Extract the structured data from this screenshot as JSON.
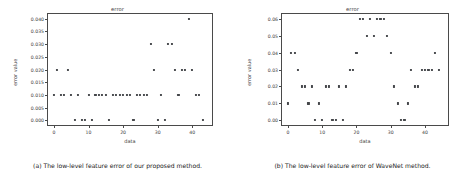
{
  "figures": [
    {
      "caption": "(a) The low-level feature error of our proposed method.",
      "chart_data": {
        "type": "scatter",
        "title": "error",
        "xlabel": "data",
        "ylabel": "error value",
        "xlim": [
          -2,
          46
        ],
        "ylim": [
          -0.0022,
          0.0422
        ],
        "xticks": [
          0,
          10,
          20,
          30,
          40
        ],
        "xticklabels": [
          "0",
          "10",
          "20",
          "30",
          "40"
        ],
        "yticks": [
          0.0,
          0.005,
          0.01,
          0.015,
          0.02,
          0.025,
          0.03,
          0.035,
          0.04
        ],
        "yticklabels": [
          "0.000",
          "0.005",
          "0.010",
          "0.015",
          "0.020",
          "0.025",
          "0.030",
          "0.035",
          "0.040"
        ],
        "grid": false,
        "legend": null,
        "marker_color": "#44464a",
        "x": [
          0,
          1,
          2,
          3,
          4,
          5,
          6,
          7,
          8,
          9,
          10,
          11,
          12,
          13,
          14,
          15,
          16,
          17,
          18,
          19,
          20,
          21,
          22,
          23,
          24,
          25,
          26,
          27,
          28,
          29,
          30,
          31,
          32,
          33,
          34,
          35,
          36,
          37,
          38,
          39,
          40,
          41,
          42,
          43
        ],
        "y": [
          0.01,
          0.02,
          0.01,
          0.01,
          0.02,
          0.01,
          0.0,
          0.01,
          0.0,
          0.0,
          0.01,
          0.0,
          0.01,
          0.01,
          0.01,
          0.01,
          0.0,
          0.01,
          0.01,
          0.01,
          0.01,
          0.01,
          0.01,
          0.0,
          0.01,
          0.01,
          0.01,
          0.01,
          0.03,
          0.02,
          0.0,
          0.01,
          0.0,
          0.03,
          0.03,
          0.02,
          0.01,
          0.02,
          0.02,
          0.04,
          0.02,
          0.01,
          0.01,
          0.0
        ]
      }
    },
    {
      "caption": "(b) The low-level feature error of WaveNet method.",
      "chart_data": {
        "type": "scatter",
        "title": "error",
        "xlabel": "data",
        "ylabel": "error value",
        "xlim": [
          -2,
          47
        ],
        "ylim": [
          -0.0033,
          0.0633
        ],
        "xticks": [
          0,
          10,
          20,
          30,
          40
        ],
        "xticklabels": [
          "0",
          "10",
          "20",
          "30",
          "40"
        ],
        "yticks": [
          0.0,
          0.01,
          0.02,
          0.03,
          0.04,
          0.05,
          0.06
        ],
        "yticklabels": [
          "0.00",
          "0.01",
          "0.02",
          "0.03",
          "0.04",
          "0.05",
          "0.06"
        ],
        "grid": false,
        "legend": null,
        "marker_color": "#44464a",
        "x": [
          0,
          1,
          2,
          3,
          4,
          5,
          6,
          7,
          8,
          9,
          10,
          11,
          12,
          13,
          14,
          15,
          16,
          17,
          18,
          19,
          20,
          21,
          22,
          23,
          24,
          25,
          26,
          27,
          28,
          29,
          30,
          31,
          32,
          33,
          34,
          35,
          36,
          37,
          38,
          39,
          40,
          41,
          42,
          43,
          44
        ],
        "y": [
          0.01,
          0.04,
          0.04,
          0.03,
          0.02,
          0.02,
          0.01,
          0.02,
          0.0,
          0.01,
          0.0,
          0.02,
          0.02,
          0.0,
          0.0,
          0.02,
          0.0,
          0.02,
          0.03,
          0.03,
          0.04,
          0.06,
          0.06,
          0.05,
          0.06,
          0.05,
          0.06,
          0.06,
          0.06,
          0.05,
          0.04,
          0.02,
          0.01,
          0.0,
          0.0,
          0.01,
          0.03,
          0.02,
          0.02,
          0.03,
          0.03,
          0.03,
          0.03,
          0.04,
          0.03
        ]
      }
    }
  ]
}
